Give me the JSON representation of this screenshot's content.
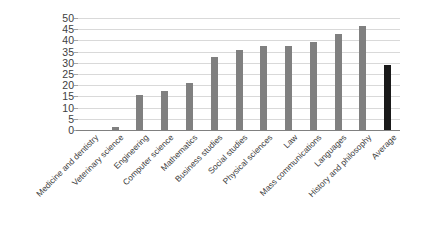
{
  "chart_data": {
    "type": "bar",
    "title": "",
    "subtitle": "",
    "xlabel": "",
    "ylabel": "",
    "ylim": [
      0,
      50
    ],
    "ytick_step": 5,
    "yticks": [
      50,
      45,
      40,
      35,
      30,
      25,
      20,
      15,
      10,
      5,
      0
    ],
    "grid": true,
    "legend": "none",
    "bar_color": "#808080",
    "emphasis_bar_color": "#1a1a1a",
    "gridline_color": "#d9d9d9",
    "axis_color": "#808080",
    "categories": [
      "Medicine and dentistry",
      "Veterinary science",
      "Engineering",
      "Computer science",
      "Mathematics",
      "Business studies",
      "Social studies",
      "Physical sciences",
      "Law",
      "Mass communications",
      "Languages",
      "History and philosophy",
      "Average"
    ],
    "values": [
      0,
      1.5,
      15.5,
      17.5,
      21,
      32.5,
      35.5,
      37.5,
      37.5,
      39.5,
      43,
      46.5,
      29
    ],
    "emphasis_index": 12,
    "emphasis_note": "Average bar rendered in dark/black, all other bars in medium gray"
  }
}
